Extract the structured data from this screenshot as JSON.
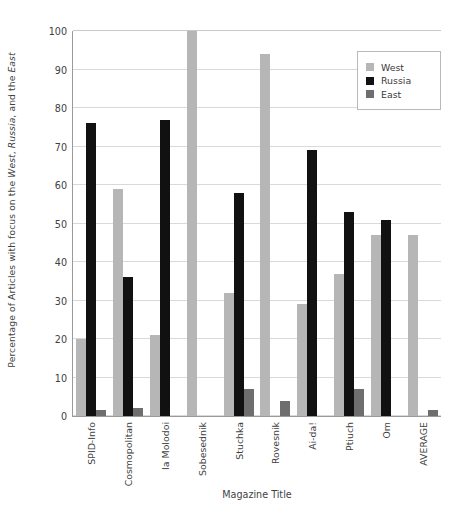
{
  "chart_data": {
    "type": "bar",
    "title": "",
    "xlabel": "Magazine Title",
    "ylabel_parts": [
      "Percentage of Articles with focus on the ",
      "West",
      ", ",
      "Russia",
      ", and the ",
      "East"
    ],
    "ylabel": "Percentage of Articles with focus on the West, Russia, and the East",
    "categories": [
      "SPID-Info",
      "Cosmopolitan",
      "Ia Molodoi",
      "Sobesednik",
      "Stuchka",
      "Rovesnik",
      "Ai-da!",
      "Ptiuch",
      "Om",
      "AVERAGE"
    ],
    "series": [
      {
        "name": "West",
        "color": "#b6b6b6",
        "values": [
          20,
          59,
          21,
          100,
          32,
          94,
          29,
          37,
          47,
          47
        ]
      },
      {
        "name": "Russia",
        "color": "#111111",
        "values": [
          76,
          36,
          77,
          0,
          58,
          0,
          69,
          53,
          51,
          0
        ]
      },
      {
        "name": "East",
        "color": "#6e6e6e",
        "values": [
          1.5,
          2,
          0,
          0,
          7,
          4,
          0,
          7,
          0,
          1.5
        ]
      }
    ],
    "ylim": [
      0,
      100
    ],
    "yticks": [
      0,
      10,
      20,
      30,
      40,
      50,
      60,
      70,
      80,
      90,
      100
    ],
    "grid": true,
    "legend_position": "top-right"
  },
  "legend": {
    "items": [
      {
        "label": "West"
      },
      {
        "label": "Russia"
      },
      {
        "label": "East"
      }
    ]
  }
}
